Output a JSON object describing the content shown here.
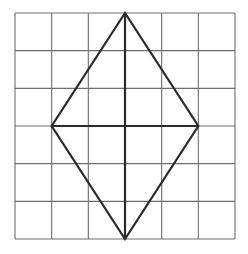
{
  "figure": {
    "grid": {
      "columns": 6,
      "rows": 6,
      "left": 15,
      "top": 13,
      "right": 235,
      "bottom": 239,
      "line_color": "#6e6e6e"
    },
    "rhombus": {
      "vertices_grid_units": [
        [
          3,
          0
        ],
        [
          1,
          3
        ],
        [
          3,
          6
        ],
        [
          5,
          3
        ]
      ],
      "stroke_color": "#2a2a2a",
      "stroke_width": 2.2
    },
    "diagonals": [
      {
        "from": [
          3,
          0
        ],
        "to": [
          3,
          6
        ]
      },
      {
        "from": [
          1,
          3
        ],
        "to": [
          5,
          3
        ]
      }
    ]
  }
}
